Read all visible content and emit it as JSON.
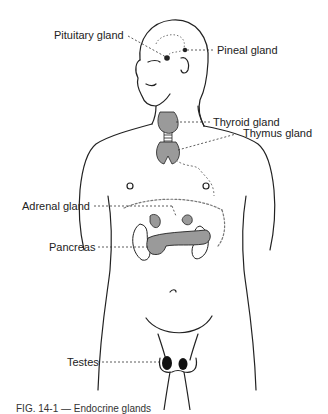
{
  "figure": {
    "caption": "FIG. 14-1 — Endocrine glands",
    "labels": {
      "pituitary": "Pituitary gland",
      "pineal": "Pineal gland",
      "thyroid": "Thyroid gland",
      "thymus": "Thymus gland",
      "adrenal": "Adrenal gland",
      "pancreas": "Pancreas",
      "testes": "Testes"
    },
    "colors": {
      "line": "#222222",
      "gland_fill": "#9a9a9a",
      "testes_fill": "#111111"
    }
  }
}
